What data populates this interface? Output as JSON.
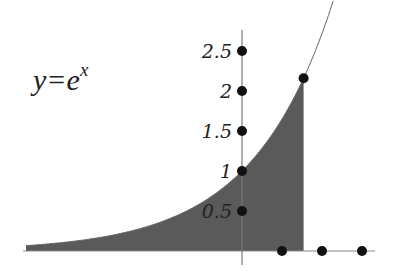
{
  "chart_data": {
    "type": "area",
    "equation": {
      "base": "y=e",
      "exponent": "x"
    },
    "xlabel": "",
    "ylabel": "",
    "y_ticks": [
      "0.5",
      "1",
      "1.5",
      "2",
      "2.5"
    ],
    "y_tick_values": [
      0.5,
      1,
      1.5,
      2,
      2.5
    ],
    "x_dot_values": [
      0.5,
      1,
      1.5
    ],
    "curve": {
      "function": "exp",
      "x_range": [
        -2.7,
        1.3
      ]
    },
    "shaded_region": {
      "x_from": -2.7,
      "x_to": 0.77,
      "color": "#5a5a5a"
    },
    "highlight_point": {
      "x": 0.77,
      "y": 2.16
    },
    "xlim": [
      -2.7,
      1.5
    ],
    "ylim": [
      0,
      2.7
    ],
    "grid": false
  }
}
